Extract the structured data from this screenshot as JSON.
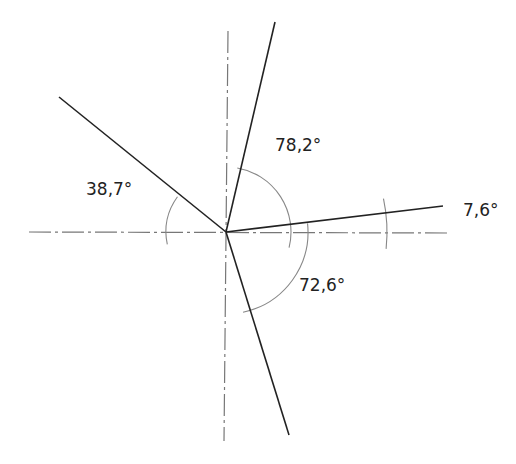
{
  "diagram": {
    "center": [
      226,
      232
    ],
    "axes": {
      "horizontal": {
        "from": [
          29,
          232
        ],
        "to": [
          448,
          233
        ],
        "style": "dash-dot",
        "color": "#777777"
      },
      "vertical": {
        "from": [
          228,
          31
        ],
        "to": [
          224,
          441
        ],
        "style": "dash-dot",
        "color": "#777777"
      }
    },
    "rays": [
      {
        "name": "ray-top",
        "to": [
          275,
          22
        ]
      },
      {
        "name": "ray-right",
        "to": [
          443,
          206
        ]
      },
      {
        "name": "ray-left",
        "to": [
          59,
          97
        ]
      },
      {
        "name": "ray-bottom",
        "to": [
          289,
          435
        ]
      }
    ],
    "arcs": [
      {
        "name": "arc-78",
        "r": 65,
        "start": 80,
        "end": -14
      },
      {
        "name": "arc-72",
        "r": 82,
        "start": 6,
        "end": -78
      },
      {
        "name": "arc-38",
        "r": 60,
        "start": 144,
        "end": 192
      },
      {
        "name": "arc-7",
        "r": 161,
        "start": 12,
        "end": -6
      }
    ],
    "labels": [
      {
        "text": "78,2°",
        "x": 275,
        "y": 145
      },
      {
        "text": "38,7°",
        "x": 86,
        "y": 189
      },
      {
        "text": "7,6°",
        "x": 463,
        "y": 210
      },
      {
        "text": "72,6°",
        "x": 299,
        "y": 285
      }
    ],
    "line_color": "#222222",
    "arc_color": "#888888"
  }
}
